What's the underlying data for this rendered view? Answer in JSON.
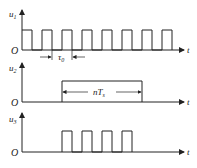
{
  "panels": [
    {
      "id": "u1",
      "ylabel": "u",
      "ylabel_sub": "1",
      "xlabel": "t",
      "origin": "O",
      "annotation": {
        "text": "τ",
        "sub": "0"
      },
      "waveform": "continuous square wave, 8 pulses"
    },
    {
      "id": "u2",
      "ylabel": "u",
      "ylabel_sub": "2",
      "xlabel": "t",
      "origin": "O",
      "annotation": {
        "text": "nT",
        "sub": "s"
      },
      "waveform": "single gate pulse of width nTs"
    },
    {
      "id": "u3",
      "ylabel": "u",
      "ylabel_sub": "3",
      "xlabel": "t",
      "origin": "O",
      "waveform": "gated square wave, 4 pulses"
    }
  ]
}
